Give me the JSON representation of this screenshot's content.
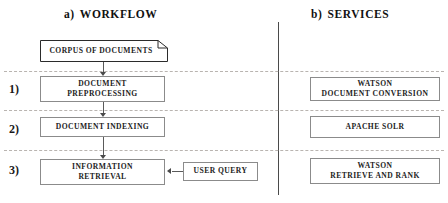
{
  "figure": {
    "width": 448,
    "height": 203,
    "background": "#ffffff",
    "box_border_color": "#8b8b8b",
    "divider_color": "#4a4a4a",
    "rule_color": "#b9b4b0",
    "arrow_color": "#4a4a4a"
  },
  "columns": {
    "workflow": {
      "tag": "a)",
      "title": "WORKFLOW"
    },
    "services": {
      "tag": "b)",
      "title": "SERVICES"
    }
  },
  "stages": [
    {
      "index_label": "1)"
    },
    {
      "index_label": "2)"
    },
    {
      "index_label": "3)"
    }
  ],
  "workflow_nodes": {
    "corpus": {
      "lines": [
        "CORPUS OF DOCUMENTS"
      ],
      "shape": "document-folded-corner"
    },
    "preprocess": {
      "lines": [
        "DOCUMENT",
        "PREPROCESSING"
      ],
      "shape": "rectangle"
    },
    "indexing": {
      "lines": [
        "DOCUMENT INDEXING"
      ],
      "shape": "rectangle"
    },
    "retrieval": {
      "lines": [
        "INFORMATION",
        "RETRIEVAL"
      ],
      "shape": "rectangle"
    },
    "user_query": {
      "lines": [
        "USER QUERY"
      ],
      "shape": "rectangle"
    }
  },
  "service_nodes": {
    "watson_document_conversion": {
      "lines": [
        "WATSON",
        "DOCUMENT CONVERSION"
      ],
      "shape": "rectangle"
    },
    "apache_solr": {
      "lines": [
        "APACHE SOLR"
      ],
      "shape": "rectangle"
    },
    "watson_retrieve_and_rank": {
      "lines": [
        "WATSON",
        "RETRIEVE AND RANK"
      ],
      "shape": "rectangle"
    }
  },
  "connectors": [
    {
      "name": "corpus-to-preprocessing",
      "from": "corpus",
      "to": "preprocess",
      "direction": "down"
    },
    {
      "name": "preprocessing-to-indexing",
      "from": "preprocess",
      "to": "indexing",
      "direction": "down"
    },
    {
      "name": "indexing-to-retrieval",
      "from": "indexing",
      "to": "retrieval",
      "direction": "down"
    },
    {
      "name": "user-query-to-retrieval",
      "from": "user_query",
      "to": "retrieval",
      "direction": "left"
    }
  ]
}
